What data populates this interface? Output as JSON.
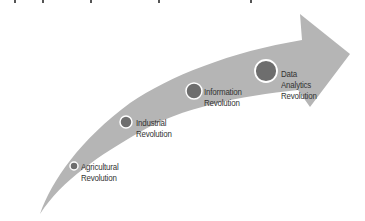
{
  "diagram": {
    "type": "curved-arrow-timeline",
    "colors": {
      "arrow_fill": "#b5b5b5",
      "node_fill": "#6e6e6e",
      "node_ring": "#ffffff",
      "text": "#333333",
      "background": "#ffffff"
    },
    "stages": [
      {
        "lines": [
          "Agricultural",
          "Revolution"
        ],
        "node": {
          "cx": 74,
          "cy": 166,
          "r": 4
        }
      },
      {
        "lines": [
          "Industrial",
          "Revolution"
        ],
        "node": {
          "cx": 126,
          "cy": 122,
          "r": 6
        }
      },
      {
        "lines": [
          "Information",
          "Revolution"
        ],
        "node": {
          "cx": 194,
          "cy": 91,
          "r": 8
        }
      },
      {
        "lines": [
          "Data",
          "Analytics",
          "Revolution"
        ],
        "node": {
          "cx": 266,
          "cy": 71,
          "r": 11
        }
      }
    ]
  }
}
